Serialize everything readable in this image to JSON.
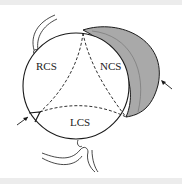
{
  "diagram": {
    "labels": {
      "rcs": "RCS",
      "ncs": "NCS",
      "lcs": "LCS"
    },
    "colors": {
      "stroke": "#1a1a1a",
      "shaded": "#a9a9a9",
      "background": "#ffffff",
      "band": "#ececec"
    }
  }
}
